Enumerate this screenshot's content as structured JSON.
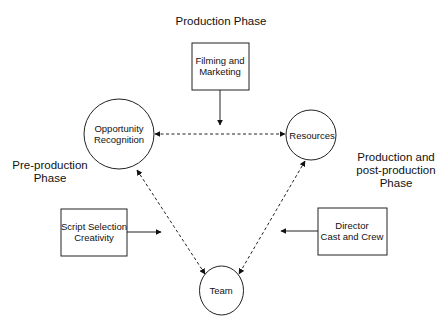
{
  "diagram": {
    "phases": {
      "production": "Production Phase",
      "pre_production": [
        "Pre-production",
        "Phase"
      ],
      "post_production": [
        "Production and",
        "post-production",
        "Phase"
      ]
    },
    "circles": {
      "opportunity": [
        "Opportunity",
        "Recognition"
      ],
      "resources": "Resources",
      "team": "Team"
    },
    "boxes": {
      "filming": [
        "Filming and",
        "Marketing"
      ],
      "script": [
        "Script Selection",
        "Creativity"
      ],
      "director": [
        "Director",
        "Cast and Crew"
      ]
    },
    "edges": [
      {
        "from": "Opportunity Recognition",
        "to": "Resources",
        "style": "dashed",
        "bidirectional": true
      },
      {
        "from": "Opportunity Recognition",
        "to": "Team",
        "style": "dashed",
        "bidirectional": true
      },
      {
        "from": "Resources",
        "to": "Team",
        "style": "dashed",
        "bidirectional": true
      },
      {
        "from": "Filming and Marketing",
        "to": "Opportunity-Resources link",
        "style": "solid"
      },
      {
        "from": "Script Selection Creativity",
        "to": "Opportunity-Team link",
        "style": "solid"
      },
      {
        "from": "Director Cast and Crew",
        "to": "Resources-Team link",
        "style": "solid"
      }
    ]
  }
}
